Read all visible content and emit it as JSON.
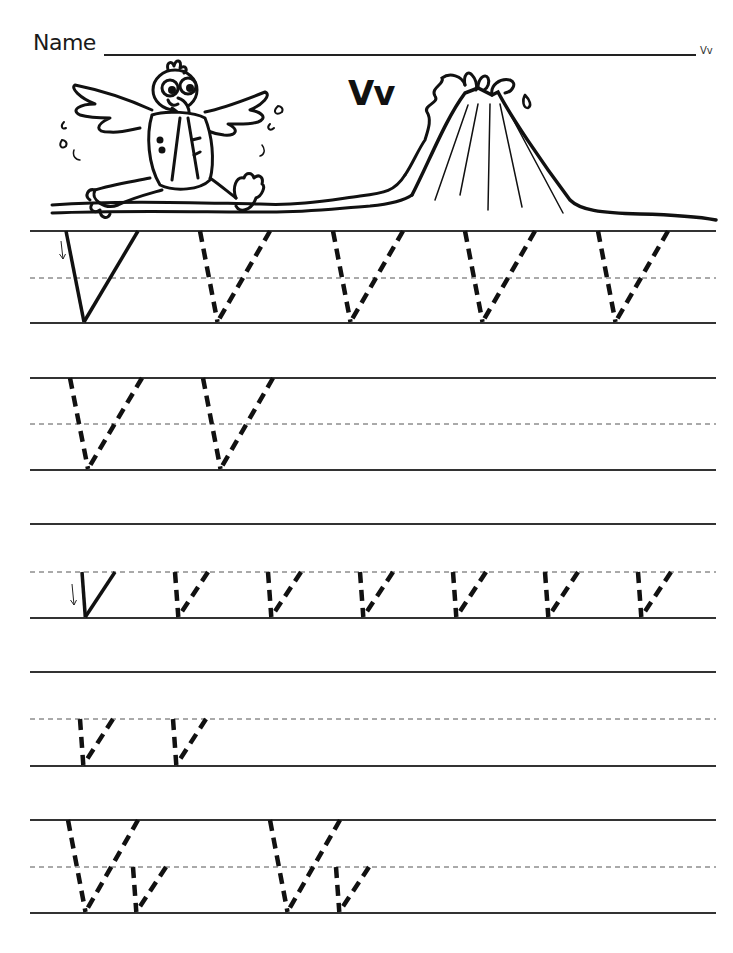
{
  "worksheet": {
    "name_label": "Name",
    "corner_label": "Vv",
    "heading": "Vv",
    "illustration": {
      "character": "parrot-in-vest",
      "scene": "volcano"
    },
    "rows": [
      {
        "type": "uppercase",
        "model_letter": "V",
        "trace_letters": [
          "V",
          "V",
          "V",
          "V"
        ],
        "stroke_arrow": true
      },
      {
        "type": "uppercase",
        "model_letter": null,
        "trace_letters": [
          "V",
          "V"
        ],
        "stroke_arrow": false
      },
      {
        "type": "lowercase",
        "model_letter": "v",
        "trace_letters": [
          "v",
          "v",
          "v",
          "v",
          "v",
          "v"
        ],
        "stroke_arrow": true
      },
      {
        "type": "lowercase",
        "model_letter": null,
        "trace_letters": [
          "v",
          "v"
        ],
        "stroke_arrow": false
      },
      {
        "type": "mixed",
        "model_letter": null,
        "trace_letters": [
          "V",
          "v",
          "V",
          "v"
        ],
        "stroke_arrow": false
      }
    ]
  }
}
